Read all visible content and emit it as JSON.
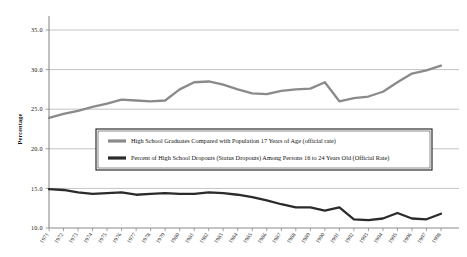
{
  "chart_data": {
    "type": "line",
    "title": "",
    "xlabel": "",
    "ylabel": "Percentage",
    "ylim": [
      10.0,
      35.0
    ],
    "ytick_labels": [
      "35.0",
      "30.0",
      "25.0",
      "20.0",
      "15.0",
      "10.0"
    ],
    "ytick_values": [
      35.0,
      30.0,
      25.0,
      20.0,
      15.0,
      10.0
    ],
    "grid": true,
    "legend_position": "center",
    "categories": [
      "1971",
      "1972",
      "1973",
      "1974",
      "1975",
      "1976",
      "1977",
      "1978",
      "1979",
      "1980",
      "1981",
      "1982",
      "1983",
      "1984",
      "1985",
      "1986",
      "1987",
      "1988",
      "1989",
      "1990",
      "1991",
      "1992",
      "1993",
      "1994",
      "1995",
      "1996",
      "1997",
      "1998"
    ],
    "series": [
      {
        "name": "High School Graduates Compared with Population 17 Years of Age (official rate)",
        "color": "#8a8a8a",
        "values": [
          23.9,
          24.4,
          24.8,
          25.3,
          25.7,
          26.2,
          26.1,
          26.0,
          26.1,
          27.5,
          28.4,
          28.5,
          28.1,
          27.5,
          27.0,
          26.9,
          27.3,
          27.5,
          27.6,
          28.4,
          26.0,
          26.4,
          26.6,
          27.2,
          28.4,
          29.5,
          29.9,
          30.5
        ]
      },
      {
        "name": "Percent of High School Dropouts (Status Dropouts) Among Persons 16 to 24 Years Old (Official Rate)",
        "color": "#2b2b2b",
        "values": [
          14.9,
          14.8,
          14.5,
          14.3,
          14.4,
          14.5,
          14.2,
          14.3,
          14.4,
          14.3,
          14.3,
          14.5,
          14.4,
          14.2,
          13.9,
          13.5,
          13.0,
          12.6,
          12.6,
          12.2,
          12.6,
          11.1,
          11.0,
          11.2,
          11.9,
          11.2,
          11.1,
          11.8
        ]
      }
    ],
    "legend": [
      {
        "label": "High School Graduates Compared with Population 17 Years of Age (official rate)",
        "color": "#8a8a8a"
      },
      {
        "label": "Percent of High School Dropouts (Status Dropouts) Among Persons 16 to 24 Years Old (Official Rate)",
        "color": "#2b2b2b"
      }
    ]
  }
}
